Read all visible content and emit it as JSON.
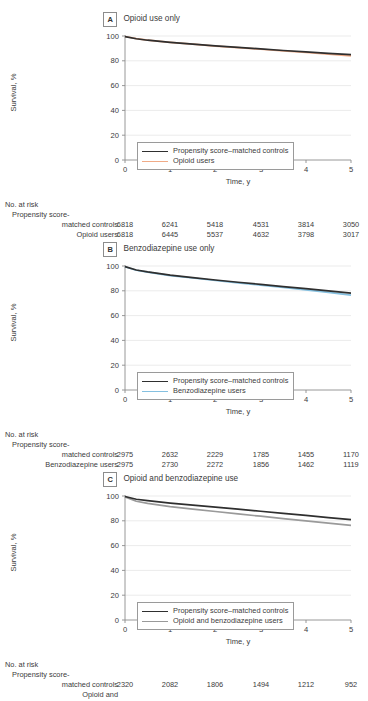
{
  "figure": {
    "axis_ylabel": "Survival, %",
    "axis_xlabel": "Time, y",
    "risk_title": "No. at risk",
    "y_ticks": [
      "0",
      "20",
      "40",
      "60",
      "80",
      "100"
    ],
    "x_ticks": [
      "0",
      "1",
      "2",
      "3",
      "4",
      "5"
    ],
    "colors": {
      "control": "#2f2f2f",
      "opioid": "#f0ab87",
      "benzo": "#85c0e0",
      "opioid_benzo": "#9a9a9a",
      "axis": "#8c8c8c",
      "grid": "#e2e2e2",
      "text": "#3b3b3b"
    }
  },
  "panels": [
    {
      "letter": "A",
      "title": "Opioid use only",
      "legend": [
        {
          "label": "Propensity score–matched controls",
          "color": "#2f2f2f"
        },
        {
          "label": "Opioid users",
          "color": "#f0ab87"
        }
      ],
      "risk_groups": [
        {
          "label_line1": "Propensity score-",
          "label_line2": "matched controls",
          "values": [
            "6818",
            "6241",
            "5418",
            "4531",
            "3814",
            "3050"
          ]
        },
        {
          "label_line1": "",
          "label_line2": "Opioid users",
          "values": [
            "6818",
            "6445",
            "5537",
            "4632",
            "3798",
            "3017"
          ]
        }
      ],
      "chart_data": {
        "type": "line",
        "title": "Opioid use only",
        "xlabel": "Time, y",
        "ylabel": "Survival, %",
        "xlim": [
          0,
          5
        ],
        "ylim": [
          0,
          100
        ],
        "x": [
          0,
          0.25,
          0.5,
          1,
          1.5,
          2,
          2.5,
          3,
          3.5,
          4,
          4.5,
          5
        ],
        "grid": true,
        "legend_position": "lower-left",
        "series": [
          {
            "name": "Propensity score–matched controls",
            "color": "#2f2f2f",
            "values": [
              99.5,
              97.8,
              96.6,
              94.8,
              93.4,
              92.0,
              90.8,
              89.6,
              88.3,
              87.2,
              86.0,
              85.0
            ]
          },
          {
            "name": "Opioid users",
            "color": "#f0ab87",
            "values": [
              99.6,
              97.9,
              96.7,
              94.9,
              93.4,
              91.9,
              90.6,
              89.3,
              88.0,
              86.7,
              85.4,
              84.0
            ]
          }
        ]
      }
    },
    {
      "letter": "B",
      "title": "Benzodiazepine use only",
      "legend": [
        {
          "label": "Propensity score–matched controls",
          "color": "#2f2f2f"
        },
        {
          "label": "Benzodiazepine users",
          "color": "#85c0e0"
        }
      ],
      "risk_groups": [
        {
          "label_line1": "Propensity score-",
          "label_line2": "matched controls",
          "values": [
            "2975",
            "2632",
            "2229",
            "1785",
            "1455",
            "1170"
          ]
        },
        {
          "label_line1": "",
          "label_line2": "Benzodiazepine users",
          "values": [
            "2975",
            "2730",
            "2272",
            "1856",
            "1462",
            "1119"
          ]
        }
      ],
      "chart_data": {
        "type": "line",
        "title": "Benzodiazepine use only",
        "xlabel": "Time, y",
        "ylabel": "Survival, %",
        "xlim": [
          0,
          5
        ],
        "ylim": [
          0,
          100
        ],
        "x": [
          0,
          0.25,
          0.5,
          1,
          1.5,
          2,
          2.5,
          3,
          3.5,
          4,
          4.5,
          5
        ],
        "grid": true,
        "legend_position": "lower-left",
        "series": [
          {
            "name": "Propensity score–matched controls",
            "color": "#2f2f2f",
            "values": [
              99.5,
              96.8,
              95.2,
              92.6,
              90.6,
              88.7,
              86.9,
              85.2,
              83.4,
              81.7,
              79.9,
              78.2
            ]
          },
          {
            "name": "Benzodiazepine users",
            "color": "#85c0e0",
            "values": [
              99.4,
              96.6,
              95.0,
              92.3,
              90.3,
              88.3,
              86.4,
              84.6,
              82.7,
              80.8,
              78.7,
              76.5
            ]
          }
        ]
      }
    },
    {
      "letter": "C",
      "title": "Opioid and benzodiazepine use",
      "legend": [
        {
          "label": "Propensity score–matched controls",
          "color": "#2f2f2f"
        },
        {
          "label": "Opioid and benzodiazepine users",
          "color": "#9a9a9a"
        }
      ],
      "risk_groups": [
        {
          "label_line1": "Propensity score-",
          "label_line2": "matched controls",
          "values": [
            "2320",
            "2082",
            "1806",
            "1494",
            "1212",
            "952"
          ]
        },
        {
          "label_line1": "",
          "label_line2": "Opioid and",
          "values": [
            "",
            "",
            "",
            "",
            "",
            ""
          ]
        }
      ],
      "chart_data": {
        "type": "line",
        "title": "Opioid and benzodiazepine use",
        "xlabel": "Time, y",
        "ylabel": "Survival, %",
        "xlim": [
          0,
          5
        ],
        "ylim": [
          0,
          100
        ],
        "x": [
          0,
          0.25,
          0.5,
          1,
          1.5,
          2,
          2.5,
          3,
          3.5,
          4,
          4.5,
          5
        ],
        "grid": true,
        "legend_position": "lower-left",
        "series": [
          {
            "name": "Propensity score–matched controls",
            "color": "#2f2f2f",
            "values": [
              99.6,
              97.4,
              96.2,
              94.2,
              92.6,
              91.0,
              89.4,
              87.7,
              86.0,
              84.3,
              82.6,
              81.0
            ]
          },
          {
            "name": "Opioid and benzodiazepine users",
            "color": "#9a9a9a",
            "values": [
              99.3,
              95.8,
              94.0,
              91.4,
              89.4,
              87.5,
              85.6,
              83.7,
              81.8,
              79.9,
              78.1,
              76.3
            ]
          }
        ]
      }
    }
  ]
}
